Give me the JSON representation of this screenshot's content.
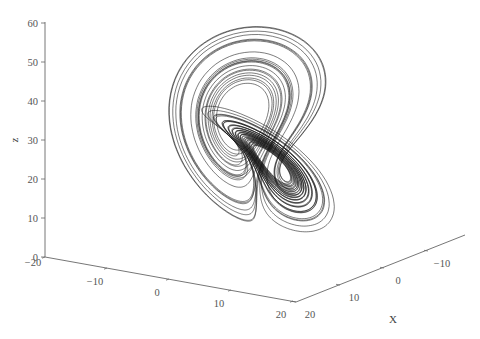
{
  "chart_data": {
    "type": "line3d",
    "title": "",
    "parameters": {
      "sigma": 10,
      "rho": 28,
      "beta": 2.6667
    },
    "axes": {
      "x": {
        "label": "X",
        "ticks": [
          20,
          10,
          0,
          -10
        ],
        "range": [
          -15,
          20
        ]
      },
      "y": {
        "label": "",
        "ticks": [
          -20,
          -10,
          0,
          10,
          20
        ],
        "range": [
          -20,
          20
        ]
      },
      "z": {
        "label": "z",
        "ticks": [
          0,
          10,
          20,
          30,
          40,
          50,
          60
        ],
        "range": [
          0,
          60
        ]
      }
    },
    "tick_labels": {
      "z": [
        "0",
        "10",
        "20",
        "30",
        "40",
        "50",
        "60"
      ],
      "y": [
        "−20",
        "−10",
        "0",
        "10",
        "20"
      ],
      "x": [
        "20",
        "10",
        "0",
        "−10"
      ]
    },
    "grid": false,
    "legend": null,
    "series": [
      {
        "name": "trajectory",
        "color": "#111111",
        "extent": {
          "x": [
            -18,
            19
          ],
          "y": [
            -24,
            26
          ],
          "z": [
            2,
            48
          ]
        }
      }
    ]
  },
  "colors": {
    "line": "#111111",
    "axis": "#666666",
    "text": "#555555",
    "background": "#ffffff"
  }
}
